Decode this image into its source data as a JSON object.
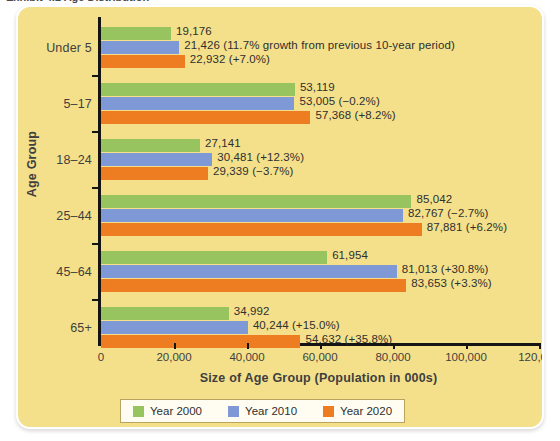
{
  "figure": {
    "clipped_title": "Exhibit 4.2  Age Distribution"
  },
  "chart_data": {
    "type": "bar",
    "orientation": "horizontal",
    "title": "",
    "xlabel": "Size of Age Group (Population in 000s)",
    "ylabel": "Age Group",
    "xlim": [
      0,
      120000
    ],
    "xticks": [
      "0",
      "20,000",
      "40,000",
      "60,000",
      "80,000",
      "100,000",
      "120,000"
    ],
    "xtick_values": [
      0,
      20000,
      40000,
      60000,
      80000,
      100000,
      120000
    ],
    "grid": false,
    "legend_position": "bottom",
    "categories": [
      "Under 5",
      "5–17",
      "18–24",
      "25–44",
      "45–64",
      "65+"
    ],
    "series": [
      {
        "name": "Year 2000",
        "color": "#97c45f",
        "values": [
          19176,
          53119,
          27141,
          85042,
          61954,
          34992
        ],
        "labels": [
          "19,176",
          "53,119",
          "27,141",
          "85,042",
          "61,954",
          "34,992"
        ]
      },
      {
        "name": "Year 2010",
        "color": "#7e99d6",
        "values": [
          21426,
          53005,
          30481,
          82767,
          81013,
          40244
        ],
        "labels": [
          "21,426 (11.7% growth from previous 10-year period)",
          "53,005 (−0.2%)",
          "30,481 (+12.3%)",
          "82,767 (−2.7%)",
          "81,013 (+30.8%)",
          "40,244 (+15.0%)"
        ]
      },
      {
        "name": "Year 2020",
        "color": "#ee7d22",
        "values": [
          22932,
          57368,
          29339,
          87881,
          83653,
          54632
        ],
        "labels": [
          "22,932 (+7.0%)",
          "57,368 (+8.2%)",
          "29,339 (−3.7%)",
          "87,881 (+6.2%)",
          "83,653 (+3.3%)",
          "54,632 (+35.8%)"
        ]
      }
    ],
    "legend": [
      {
        "label": "Year 2000",
        "color": "#97c45f"
      },
      {
        "label": "Year 2010",
        "color": "#7e99d6"
      },
      {
        "label": "Year 2020",
        "color": "#ee7d22"
      }
    ]
  },
  "style": {
    "panel_background": "#f4e08a",
    "axis_color": "#141414",
    "text_color": "#3f3f3f"
  }
}
